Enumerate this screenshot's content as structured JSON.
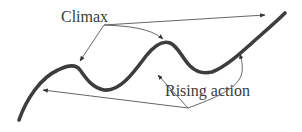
{
  "diagram": {
    "labels": {
      "climax": "Climax",
      "rising_action": "Rising action"
    },
    "colors": {
      "curve": "#3d3d3d",
      "pointer": "#555555",
      "text": "#3a3a3a",
      "background": "#ffffff"
    },
    "curve": {
      "description": "Thick wavy line rising from lower-left to upper-right with two local peaks (climaxes) and two valleys",
      "peaks": 2,
      "valleys": 2
    },
    "pointers": {
      "climax_targets": [
        "first-peak",
        "second-peak",
        "final-high-point"
      ],
      "rising_action_targets": [
        "first-rise",
        "second-rise",
        "third-rise"
      ]
    }
  }
}
